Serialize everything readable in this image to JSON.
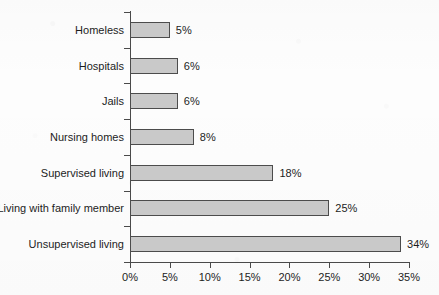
{
  "chart_data": {
    "type": "bar",
    "orientation": "horizontal",
    "title": "",
    "subtitle": "",
    "xlabel": "",
    "ylabel": "",
    "xlim": [
      0,
      35
    ],
    "grid": false,
    "legend": false,
    "categories": [
      "Homeless",
      "Hospitals",
      "Jails",
      "Nursing homes",
      "Supervised living",
      "Living with family member",
      "Unsupervised living"
    ],
    "values": [
      5,
      6,
      6,
      8,
      18,
      25,
      34
    ],
    "value_labels": [
      "5%",
      "6%",
      "6%",
      "8%",
      "18%",
      "25%",
      "34%"
    ],
    "xticks": [
      0,
      5,
      10,
      15,
      20,
      25,
      30,
      35
    ],
    "xtick_labels": [
      "0%",
      "5%",
      "10%",
      "15%",
      "20%",
      "25%",
      "30%",
      "35%"
    ],
    "bar_fill_color": "#c9c9c9",
    "bar_edge_color": "#4c4c4c",
    "axis_color": "#4a4a4a",
    "text_color": "#1d1d1d",
    "background_color": "#fdfdfd"
  }
}
